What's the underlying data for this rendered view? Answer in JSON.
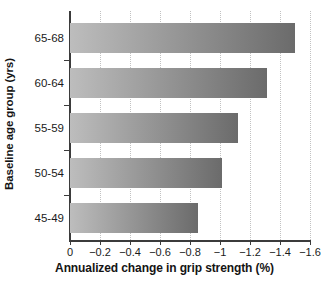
{
  "chart_data": {
    "type": "bar",
    "orientation": "horizontal",
    "title": "",
    "xlabel": "Annualized change in grip strength (%)",
    "ylabel": "Baseline age group (yrs)",
    "categories": [
      "45-49",
      "50-54",
      "55-59",
      "60-64",
      "65-68"
    ],
    "values": [
      -0.85,
      -1.01,
      -1.12,
      -1.31,
      -1.5
    ],
    "xlim": [
      0,
      -1.6
    ],
    "ylim": null,
    "xticks": [
      0,
      -0.2,
      -0.4,
      -0.6,
      -0.8,
      -1,
      -1.2,
      -1.4,
      -1.6
    ],
    "xtick_labels": [
      "0",
      "−0.2",
      "−0.4",
      "−0.6",
      "−0.8",
      "−1",
      "−1.2",
      "−1.4",
      "−1.6"
    ],
    "ytick_labels_top_to_bottom": [
      "65-68",
      "60-64",
      "55-59",
      "50-54",
      "45-49"
    ],
    "grid": "vertical-dotted",
    "legend": null,
    "bar_fill": "horizontal-gradient",
    "colors": {
      "bar_gradient_start": "#bdbdbd",
      "bar_gradient_end": "#6b6b6b",
      "gridline": "#c2c2c2",
      "axis": "#3b3b3b",
      "text": "#1a1a1a",
      "background": "#ffffff"
    }
  },
  "axes": {
    "x_title": "Annualized change in grip strength (%)",
    "y_title": "Baseline age group (yrs)"
  }
}
